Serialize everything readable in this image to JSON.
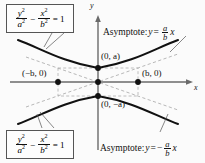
{
  "figure": {
    "type": "hyperbola-diagram",
    "axes": {
      "x_label": "x",
      "y_label": "y",
      "origin_px": [
        98,
        82
      ],
      "x_axis_y_px": 82,
      "y_axis_x_px": 98
    },
    "equation_top": {
      "numerator_1": "y",
      "denominator_1": "a",
      "numerator_2": "x",
      "denominator_2": "b",
      "operator": "−",
      "equals": "= 1",
      "exponent": "2"
    },
    "equation_bottom": {
      "numerator_1": "y",
      "denominator_1": "a",
      "numerator_2": "x",
      "denominator_2": "b",
      "operator": "−",
      "equals": "= 1",
      "exponent": "2"
    },
    "asymptote_upper": {
      "prefix": "Asymptote: ",
      "lhs": "y",
      "equals": "=",
      "sign": "",
      "num": "a",
      "den": "b",
      "var": "x"
    },
    "asymptote_lower": {
      "prefix": "Asymptote: ",
      "lhs": "y",
      "equals": "=",
      "sign": "−",
      "num": "a",
      "den": "b",
      "var": "x"
    },
    "points": [
      {
        "name": "vertex-upper",
        "label": "(0, a)",
        "x": 98,
        "y": 68
      },
      {
        "name": "origin",
        "label": "",
        "x": 98,
        "y": 82
      },
      {
        "name": "vertex-lower",
        "label": "(0, −a)",
        "x": 98,
        "y": 96
      },
      {
        "name": "point-neg-b",
        "label": "(−b, 0)",
        "x": 58,
        "y": 82
      },
      {
        "name": "point-pos-b",
        "label": "(b, 0)",
        "x": 138,
        "y": 82
      }
    ],
    "colors": {
      "curve": "#111111",
      "axis": "#555555",
      "dashed": "#aaaaaa",
      "box_border": "#555555",
      "background": "#fbfbfb",
      "text": "#111111"
    },
    "geometry": {
      "a_px": 14,
      "b_px": 40,
      "x_range_px": [
        8,
        190
      ],
      "y_range_px": [
        18,
        150
      ]
    }
  }
}
